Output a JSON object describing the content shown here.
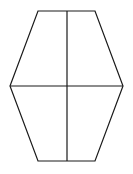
{
  "diagram": {
    "shape": "hexagon",
    "stroke_color": "#1a1a1a",
    "background": "#ffffff",
    "vertices": [
      [
        38,
        11
      ],
      [
        95,
        11
      ],
      [
        123,
        86
      ],
      [
        95,
        161
      ],
      [
        38,
        161
      ],
      [
        10,
        86
      ]
    ],
    "vertical_line": [
      [
        67,
        11
      ],
      [
        67,
        161
      ]
    ],
    "horizontal_line": [
      [
        10,
        86
      ],
      [
        123,
        86
      ]
    ]
  }
}
